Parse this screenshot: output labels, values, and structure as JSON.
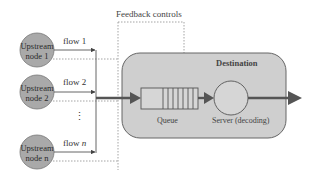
{
  "diagram": {
    "feedback_label": "Feedback controls",
    "destination_label": "Destination",
    "queue_label": "Queue",
    "server_label": "Server (decoding)",
    "ellipsis": "⋮",
    "nodes": [
      {
        "line1": "Upstream",
        "line2": "node 1",
        "flow": "flow 1",
        "flow_prefix": "flow ",
        "flow_var": "1"
      },
      {
        "line1": "Upstream",
        "line2": "node 2",
        "flow": "flow 2",
        "flow_prefix": "flow ",
        "flow_var": "2"
      },
      {
        "line1": "Upstream",
        "line2": "node n",
        "flow": "flow n",
        "flow_prefix": "flow ",
        "flow_var": "n"
      }
    ],
    "colors": {
      "node_fill": "#a9a9a9",
      "destination_fill": "#cfcfcf",
      "line": "#555555",
      "arrow": "#555555",
      "dotted": "#9a9a9a"
    }
  }
}
